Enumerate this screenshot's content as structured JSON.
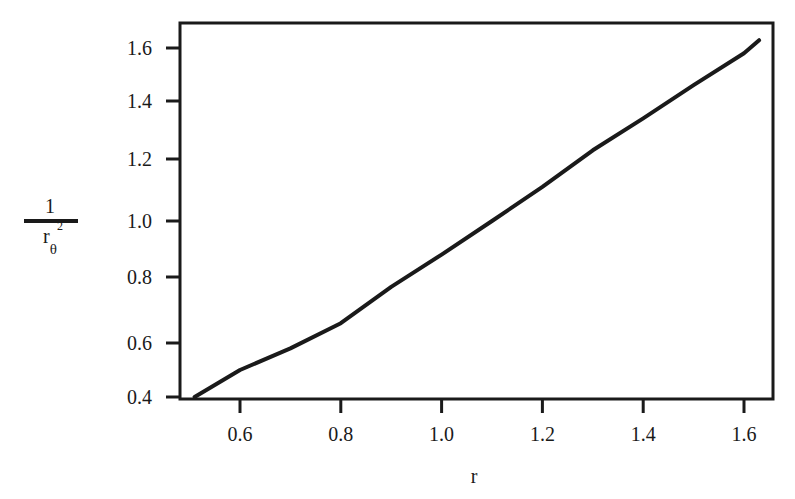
{
  "chart_data": {
    "type": "line",
    "title": "",
    "xlabel": "r",
    "ylabel": "1 / r_θ²",
    "ylabel_parts": {
      "numerator": "1",
      "denominator": "r",
      "subscript": "θ",
      "superscript": "2"
    },
    "xlim": [
      0.48,
      1.66
    ],
    "ylim": [
      0.4,
      1.69
    ],
    "x_ticks": [
      0.6,
      0.8,
      1.0,
      1.2,
      1.4,
      1.6
    ],
    "x_tick_labels": [
      "0.6",
      "0.8",
      "1.0",
      "1.2",
      "1.4",
      "1.6"
    ],
    "y_ticks": [
      0.4,
      0.6,
      0.8,
      1.0,
      1.2,
      1.4,
      1.6
    ],
    "y_tick_labels": [
      "0.4",
      "0.6",
      "0.8",
      "1.0",
      "1.2",
      "1.4",
      "1.6"
    ],
    "grid": false,
    "legend": null,
    "series": [
      {
        "name": "1/r_θ² vs r",
        "x": [
          0.51,
          0.6,
          0.7,
          0.8,
          0.9,
          1.0,
          1.1,
          1.2,
          1.3,
          1.4,
          1.5,
          1.6,
          1.63
        ],
        "values": [
          0.4,
          0.5,
          0.58,
          0.66,
          0.77,
          0.88,
          1.0,
          1.11,
          1.23,
          1.34,
          1.46,
          1.58,
          1.63
        ]
      }
    ]
  }
}
